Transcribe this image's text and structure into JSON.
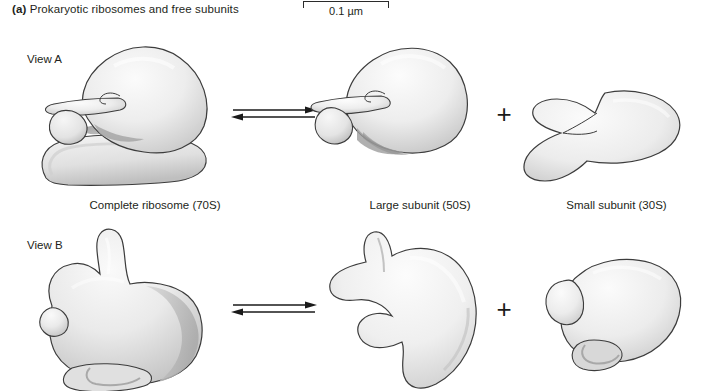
{
  "figure": {
    "panel_letter": "(a)",
    "panel_title": "Prokaryotic ribosomes and free subunits",
    "scale_bar": {
      "label": "0.1 µm"
    },
    "views": [
      {
        "id": "view-a",
        "label": "View A"
      },
      {
        "id": "view-b",
        "label": "View B"
      }
    ],
    "columns": [
      {
        "id": "complete-ribosome",
        "caption": "Complete ribosome (70S)"
      },
      {
        "id": "large-subunit",
        "caption": "Large subunit (50S)"
      },
      {
        "id": "small-subunit",
        "caption": "Small subunit (30S)"
      }
    ],
    "operators": {
      "equilibrium": "⇌",
      "plus": "+"
    },
    "colors": {
      "outline": "#3a3a3a",
      "fill_light": "#f2f2f2",
      "fill_mid": "#e2e2e2",
      "fill_shadow": "#b9b9b9",
      "fill_deep_shadow": "#9a9a9a",
      "text": "#231f20",
      "background": "#ffffff"
    }
  }
}
